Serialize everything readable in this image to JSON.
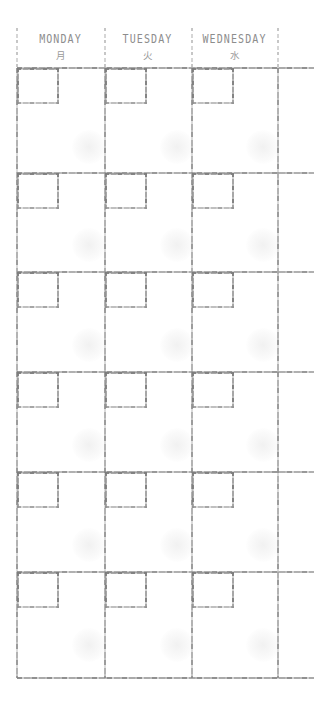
{
  "document": {
    "type": "weekly-planner-grid",
    "title": "Weekly Planner",
    "ink_color": "#8a8a8a",
    "paper_color": "#ffffff"
  },
  "header": {
    "days": [
      {
        "name": "MONDAY",
        "kanji": "月"
      },
      {
        "name": "TUESDAY",
        "kanji": "火"
      },
      {
        "name": "WEDNESDAY",
        "kanji": "水"
      }
    ]
  },
  "grid": {
    "column_count": 3,
    "row_count": 6,
    "columns_x": [
      17,
      105,
      192,
      278
    ],
    "rows_y": [
      68,
      173,
      272,
      372,
      472,
      572,
      678
    ],
    "header_top_y": 28,
    "date_box": {
      "width": 42,
      "height": 36
    }
  },
  "cells": [
    {
      "row": 1,
      "col": 1,
      "date": "",
      "note": ""
    },
    {
      "row": 1,
      "col": 2,
      "date": "",
      "note": ""
    },
    {
      "row": 1,
      "col": 3,
      "date": "",
      "note": ""
    },
    {
      "row": 2,
      "col": 1,
      "date": "",
      "note": ""
    },
    {
      "row": 2,
      "col": 2,
      "date": "",
      "note": ""
    },
    {
      "row": 2,
      "col": 3,
      "date": "",
      "note": ""
    },
    {
      "row": 3,
      "col": 1,
      "date": "",
      "note": ""
    },
    {
      "row": 3,
      "col": 2,
      "date": "",
      "note": ""
    },
    {
      "row": 3,
      "col": 3,
      "date": "",
      "note": ""
    },
    {
      "row": 4,
      "col": 1,
      "date": "",
      "note": ""
    },
    {
      "row": 4,
      "col": 2,
      "date": "",
      "note": ""
    },
    {
      "row": 4,
      "col": 3,
      "date": "",
      "note": ""
    },
    {
      "row": 5,
      "col": 1,
      "date": "",
      "note": ""
    },
    {
      "row": 5,
      "col": 2,
      "date": "",
      "note": ""
    },
    {
      "row": 5,
      "col": 3,
      "date": "",
      "note": ""
    },
    {
      "row": 6,
      "col": 1,
      "date": "",
      "note": ""
    },
    {
      "row": 6,
      "col": 2,
      "date": "",
      "note": ""
    },
    {
      "row": 6,
      "col": 3,
      "date": "",
      "note": ""
    }
  ]
}
